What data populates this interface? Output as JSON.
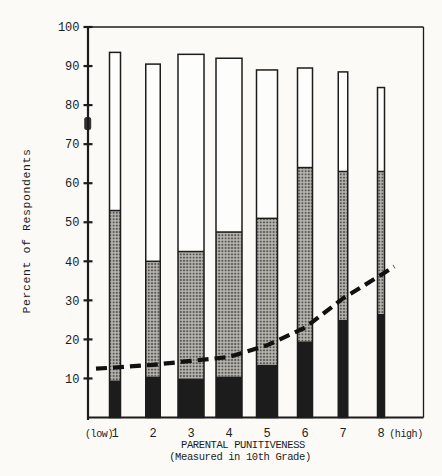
{
  "chart_data": {
    "type": "bar",
    "stacked": true,
    "title": "",
    "ylabel": "Percent of Respondents",
    "xlabel": "PARENTAL PUNITIVENESS (Measured in 10th Grade)",
    "xlabel_line1": "PARENTAL PUNITIVENESS",
    "xlabel_line2": "(Measured in 10th Grade)",
    "x_prefix": "(low)",
    "x_suffix": "(high)",
    "ylim": [
      0,
      100
    ],
    "grid": false,
    "legend": "none",
    "y_ticks": [
      10,
      20,
      30,
      40,
      50,
      60,
      70,
      80,
      90,
      100
    ],
    "categories": [
      "1",
      "2",
      "3",
      "4",
      "5",
      "6",
      "7",
      "8"
    ],
    "series": [
      {
        "name": "solid black (bottom segment)",
        "stack_top": [
          9.5,
          10.5,
          10,
          10.5,
          13.5,
          19.5,
          25,
          26.5
        ],
        "segment_heights": [
          9.5,
          10.5,
          10,
          10.5,
          13.5,
          19.5,
          25,
          26.5
        ]
      },
      {
        "name": "halftone shaded (middle segment)",
        "stack_top": [
          53,
          40,
          42.5,
          47.5,
          51,
          64,
          63,
          63
        ],
        "segment_heights": [
          43.5,
          29.5,
          32.5,
          37,
          37.5,
          44.5,
          38,
          36.5
        ]
      },
      {
        "name": "open white (top segment)",
        "stack_top": [
          93.5,
          90.5,
          93,
          92,
          89,
          89.5,
          88.5,
          84.5
        ],
        "segment_heights": [
          40.5,
          50.5,
          50.5,
          44.5,
          38,
          25.5,
          25.5,
          21.5
        ]
      }
    ],
    "dashed_line": {
      "name": "dashed trend line",
      "x_categories": [
        0.5,
        1,
        2,
        3,
        4,
        5,
        6,
        7,
        8,
        8.35
      ],
      "values": [
        12.5,
        12.8,
        13.5,
        14.5,
        15.5,
        18.5,
        23,
        30.5,
        36.5,
        38.7
      ]
    },
    "colors": {
      "ink": "#1c1c1c",
      "shaded_base": "#b8b6b0",
      "shaded_dot": "#55524d",
      "bar_white": "#fdfdfb",
      "paper": "#fbfaf7"
    },
    "layout_px": {
      "left": 88,
      "right": 423.5,
      "top": 27,
      "bottom": 417.5,
      "first_center": 115,
      "spacing": 38,
      "bar_widths": [
        11,
        14.5,
        26,
        26,
        21,
        15,
        9.5,
        7
      ]
    }
  }
}
